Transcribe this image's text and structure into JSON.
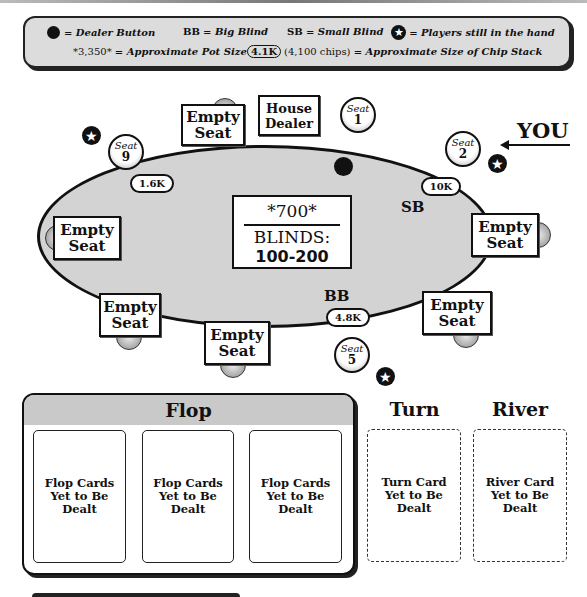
{
  "legend": {
    "dealer_button": "= Dealer Button",
    "bb": "BB",
    "bb_desc": "= Big Blind",
    "sb": "SB",
    "sb_desc": "= Small Blind",
    "players_desc": "= Players still in the hand",
    "pot_example": "*3,350*",
    "pot_desc": "= Approximate Pot Size",
    "chip_example": "4.1K",
    "chip_example_detail": "(4,100 chips)",
    "chip_desc": "= Approximate Size of Chip Stack"
  },
  "table": {
    "pot": "*700*",
    "blinds_label": "BLINDS:",
    "blinds_value": "100-200",
    "house_dealer": [
      "House",
      "Dealer"
    ],
    "empty_seat": [
      "Empty",
      "Seat"
    ],
    "seat_word": "Seat",
    "seats": [
      {
        "number": "1",
        "status": "seat"
      },
      {
        "number": "2",
        "status": "you",
        "chips": "10K",
        "blind": "SB",
        "in_hand": true
      },
      {
        "number": "5",
        "status": "seat",
        "chips": "4.8K",
        "blind": "BB",
        "in_hand": true
      },
      {
        "number": "9",
        "status": "seat",
        "chips": "1.6K",
        "in_hand": true
      }
    ],
    "you_label": "YOU",
    "sb_label": "SB",
    "bb_label": "BB"
  },
  "board": {
    "flop_title": "Flop",
    "turn_title": "Turn",
    "river_title": "River",
    "flop_cards": [
      [
        "Flop Cards",
        "Yet to Be",
        "Dealt"
      ],
      [
        "Flop Cards",
        "Yet to Be",
        "Dealt"
      ],
      [
        "Flop Cards",
        "Yet to Be",
        "Dealt"
      ]
    ],
    "turn_card": [
      "Turn Card",
      "Yet to Be",
      "Dealt"
    ],
    "river_card": [
      "River Card",
      "Yet to Be",
      "Dealt"
    ]
  },
  "colors": {
    "felt": "#d3d3d3",
    "legend_bg": "#dcdcdc",
    "flop_header": "#c9c9c9",
    "ink": "#111111"
  }
}
